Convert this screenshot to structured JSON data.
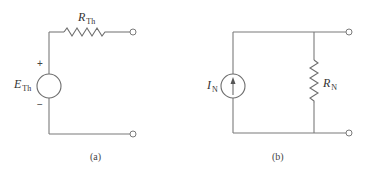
{
  "diagram": {
    "colors": {
      "wire": "#7a7a7a",
      "text": "#333333",
      "background": "#ffffff"
    },
    "circuit_a": {
      "caption": "(a)",
      "source": {
        "type": "voltage-source",
        "symbol": "E",
        "subscript": "Th",
        "plus_sign": "+",
        "minus_sign": "−"
      },
      "resistor": {
        "type": "series-resistor",
        "symbol": "R",
        "subscript": "Th"
      },
      "terminals": 2
    },
    "circuit_b": {
      "caption": "(b)",
      "source": {
        "type": "current-source",
        "symbol": "I",
        "subscript": "N",
        "arrow_direction": "up"
      },
      "resistor": {
        "type": "parallel-resistor",
        "symbol": "R",
        "subscript": "N"
      },
      "terminals": 2
    }
  }
}
